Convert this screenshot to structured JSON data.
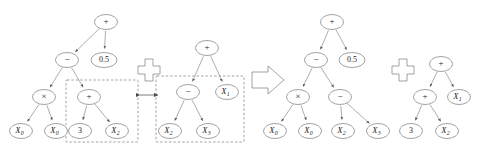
{
  "figure": {
    "type": "genetic-programming-crossover-diagram",
    "background_color": "#ffffff",
    "node_stroke_color": "#7a7a7a",
    "edge_color": "#8a8a8a",
    "text_color": "#1a1a1a",
    "selection_box_style": "dashed"
  },
  "symbols": {
    "crossover_operator": "crossover-plus-symbol",
    "swap_arrow": "double-headed-exchange-arrow",
    "transform_arrow": "right-block-arrow",
    "crossover_label": "+",
    "transform_label": "⇒"
  },
  "trees": {
    "parent1": {
      "name": "parent-tree-1",
      "root": "+",
      "nodes": [
        {
          "id": "p1n0",
          "label": "+",
          "kind": "operator",
          "cx": 106,
          "cy": 22
        },
        {
          "id": "p1n1",
          "label": "−",
          "kind": "operator",
          "cx": 67,
          "cy": 60
        },
        {
          "id": "p1n2",
          "label": "0.5",
          "kind": "constant",
          "cx": 104,
          "cy": 60
        },
        {
          "id": "p1n3",
          "label": "×",
          "kind": "operator",
          "cx": 44,
          "cy": 97
        },
        {
          "id": "p1n4",
          "label": "+",
          "kind": "operator",
          "cx": 89,
          "cy": 97
        },
        {
          "id": "p1n5",
          "label": "X",
          "sub": "0",
          "kind": "variable",
          "cx": 21,
          "cy": 131
        },
        {
          "id": "p1n6",
          "label": "X",
          "sub": "0",
          "kind": "variable",
          "cx": 56,
          "cy": 131
        },
        {
          "id": "p1n7",
          "label": "3",
          "kind": "constant",
          "cx": 80,
          "cy": 131
        },
        {
          "id": "p1n8",
          "label": "X",
          "sub": "2",
          "kind": "variable",
          "cx": 117,
          "cy": 131
        }
      ],
      "edges": [
        [
          "p1n0",
          "p1n1"
        ],
        [
          "p1n0",
          "p1n2"
        ],
        [
          "p1n1",
          "p1n3"
        ],
        [
          "p1n1",
          "p1n4"
        ],
        [
          "p1n3",
          "p1n5"
        ],
        [
          "p1n3",
          "p1n6"
        ],
        [
          "p1n4",
          "p1n7"
        ],
        [
          "p1n4",
          "p1n8"
        ]
      ],
      "selection_box": {
        "x": 66,
        "y": 80,
        "w": 72,
        "h": 62,
        "name": "selected-subtree-parent-1"
      }
    },
    "parent2": {
      "name": "parent-tree-2",
      "root": "+",
      "nodes": [
        {
          "id": "p2n0",
          "label": "+",
          "kind": "operator",
          "cx": 207,
          "cy": 48
        },
        {
          "id": "p2n1",
          "label": "−",
          "kind": "operator",
          "cx": 188,
          "cy": 92
        },
        {
          "id": "p2n2",
          "label": "X",
          "sub": "1",
          "kind": "variable",
          "cx": 227,
          "cy": 92
        },
        {
          "id": "p2n3",
          "label": "X",
          "sub": "2",
          "kind": "variable",
          "cx": 170,
          "cy": 131
        },
        {
          "id": "p2n4",
          "label": "X",
          "sub": "3",
          "kind": "variable",
          "cx": 208,
          "cy": 131
        }
      ],
      "edges": [
        [
          "p2n0",
          "p2n1"
        ],
        [
          "p2n0",
          "p2n2"
        ],
        [
          "p2n1",
          "p2n3"
        ],
        [
          "p2n1",
          "p2n4"
        ]
      ],
      "selection_box": {
        "x": 156,
        "y": 76,
        "w": 88,
        "h": 66,
        "name": "selected-subtree-parent-2"
      }
    },
    "child1": {
      "name": "offspring-tree-1",
      "root": "+",
      "nodes": [
        {
          "id": "c1n0",
          "label": "+",
          "kind": "operator",
          "cx": 332,
          "cy": 22
        },
        {
          "id": "c1n1",
          "label": "−",
          "kind": "operator",
          "cx": 316,
          "cy": 60
        },
        {
          "id": "c1n2",
          "label": "0.5",
          "kind": "constant",
          "cx": 352,
          "cy": 60
        },
        {
          "id": "c1n3",
          "label": "×",
          "kind": "operator",
          "cx": 298,
          "cy": 97
        },
        {
          "id": "c1n4",
          "label": "−",
          "kind": "operator",
          "cx": 340,
          "cy": 97
        },
        {
          "id": "c1n5",
          "label": "X",
          "sub": "0",
          "kind": "variable",
          "cx": 275,
          "cy": 131
        },
        {
          "id": "c1n6",
          "label": "X",
          "sub": "0",
          "kind": "variable",
          "cx": 310,
          "cy": 131
        },
        {
          "id": "c1n7",
          "label": "X",
          "sub": "2",
          "kind": "variable",
          "cx": 343,
          "cy": 131
        },
        {
          "id": "c1n8",
          "label": "X",
          "sub": "3",
          "kind": "variable",
          "cx": 378,
          "cy": 131
        }
      ],
      "edges": [
        [
          "c1n0",
          "c1n1"
        ],
        [
          "c1n0",
          "c1n2"
        ],
        [
          "c1n1",
          "c1n3"
        ],
        [
          "c1n1",
          "c1n4"
        ],
        [
          "c1n3",
          "c1n5"
        ],
        [
          "c1n3",
          "c1n6"
        ],
        [
          "c1n4",
          "c1n7"
        ],
        [
          "c1n4",
          "c1n8"
        ]
      ]
    },
    "child2": {
      "name": "offspring-tree-2",
      "root": "+",
      "nodes": [
        {
          "id": "c2n0",
          "label": "+",
          "kind": "operator",
          "cx": 441,
          "cy": 64
        },
        {
          "id": "c2n1",
          "label": "+",
          "kind": "operator",
          "cx": 425,
          "cy": 97
        },
        {
          "id": "c2n2",
          "label": "X",
          "sub": "1",
          "kind": "variable",
          "cx": 459,
          "cy": 97
        },
        {
          "id": "c2n3",
          "label": "3",
          "kind": "constant",
          "cx": 411,
          "cy": 131
        },
        {
          "id": "c2n4",
          "label": "X",
          "sub": "2",
          "kind": "variable",
          "cx": 447,
          "cy": 131
        }
      ],
      "edges": [
        [
          "c2n0",
          "c2n1"
        ],
        [
          "c2n0",
          "c2n2"
        ],
        [
          "c2n1",
          "c2n3"
        ],
        [
          "c2n1",
          "c2n4"
        ]
      ]
    }
  }
}
